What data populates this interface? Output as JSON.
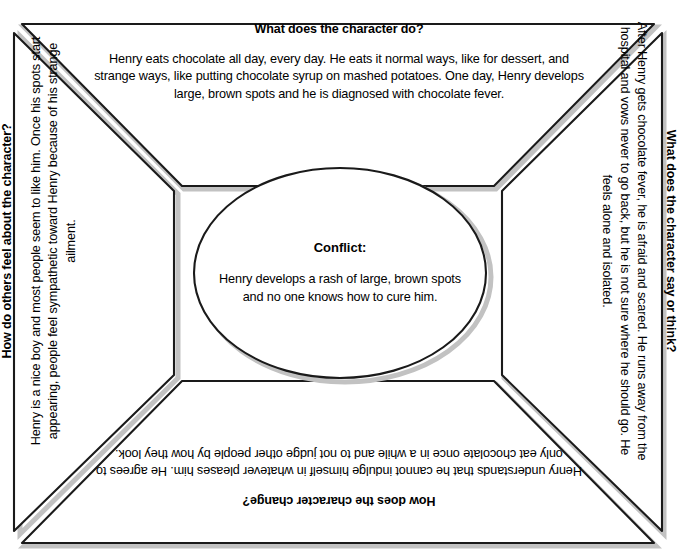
{
  "worksheet": {
    "type": "character-analysis-graphic-organizer",
    "center": {
      "label": "Conflict:",
      "body": "Henry develops a rash of large, brown spots and no one knows how to cure him."
    },
    "quadrants": {
      "top": {
        "heading": "What does the character do?",
        "body": "Henry eats chocolate all day, every day. He eats it normal ways, like for dessert, and strange ways, like putting chocolate syrup on mashed potatoes. One day, Henry develops large, brown spots and he is diagnosed with chocolate fever."
      },
      "right": {
        "heading": "What does the character say or think?",
        "body": "After Henry gets chocolate fever, he is afraid and scared. He runs away from the hospital and vows never to go back, but he is not sure where he should go. He feels alone and isolated."
      },
      "bottom": {
        "heading": "How does the character change?",
        "body": "Henry understands that he cannot indulge himself in whatever pleases him. He agrees to only eat chocolate once in a while and to not judge other people by how they look."
      },
      "left": {
        "heading": "How do others feel about the character?",
        "body": "Henry is a nice boy and most people seem to like him. Once his spots start appearing, people feel sympathetic toward Henry because of his strange ailment."
      }
    },
    "colors": {
      "ink": "#000000",
      "paper": "#ffffff",
      "shadow": "#b9b9b9"
    }
  }
}
